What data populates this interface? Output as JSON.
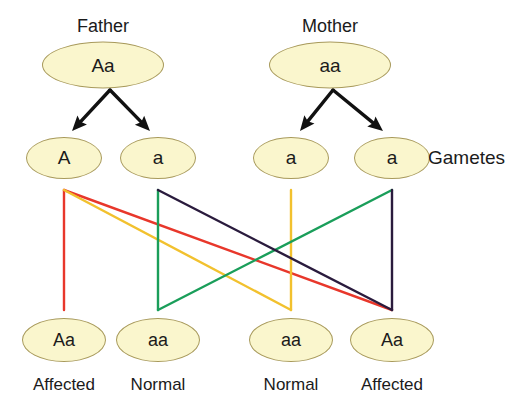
{
  "diagram": {
    "title_father": "Father",
    "title_mother": "Mother",
    "gametes_label": "Gametes"
  },
  "parents": [
    {
      "name": "father",
      "genotype": "Aa",
      "title": "Father",
      "cx": 103,
      "cy": 65,
      "title_cx": 103,
      "title_cy": 26
    },
    {
      "name": "mother",
      "genotype": "aa",
      "title": "Mother",
      "cx": 330,
      "cy": 65,
      "title_cx": 330,
      "title_cy": 26
    }
  ],
  "gametes": [
    {
      "name": "father-gamete-A",
      "allele": "A",
      "cx": 64,
      "cy": 158
    },
    {
      "name": "father-gamete-a",
      "allele": "a",
      "cx": 158,
      "cy": 158
    },
    {
      "name": "mother-gamete-a-1",
      "allele": "a",
      "cx": 291,
      "cy": 158
    },
    {
      "name": "mother-gamete-a-2",
      "allele": "a",
      "cx": 392,
      "cy": 158
    }
  ],
  "gametes_side_label": {
    "text": "Gametes",
    "x": 428,
    "y": 158
  },
  "offspring": [
    {
      "name": "offspring-1",
      "genotype": "Aa",
      "phenotype": "Affected",
      "cx": 64,
      "cy": 340,
      "label_cy": 385
    },
    {
      "name": "offspring-2",
      "genotype": "aa",
      "phenotype": "Normal",
      "cx": 158,
      "cy": 340,
      "label_cy": 385
    },
    {
      "name": "offspring-3",
      "genotype": "aa",
      "phenotype": "Normal",
      "cx": 291,
      "cy": 340,
      "label_cy": 385
    },
    {
      "name": "offspring-4",
      "genotype": "Aa",
      "phenotype": "Affected",
      "cx": 392,
      "cy": 340,
      "label_cy": 385
    }
  ],
  "meiosis_arrows": [
    {
      "name": "father-meiosis-arrows",
      "apex_x": 110,
      "apex_y": 90,
      "left_x": 72,
      "left_y": 131,
      "right_x": 150,
      "right_y": 131
    },
    {
      "name": "mother-meiosis-arrows",
      "apex_x": 333,
      "apex_y": 90,
      "left_x": 300,
      "left_y": 131,
      "right_x": 383,
      "right_y": 131
    }
  ],
  "fertilization_lines": [
    {
      "name": "line-red",
      "color": "#e8372b",
      "from_x": 64,
      "to_x": 392,
      "vertical_x": 64,
      "top_y": 190,
      "bottom_y": 310
    },
    {
      "name": "line-gold",
      "color": "#f2c12e",
      "from_x": 64,
      "to_x": 291,
      "vertical_x": 291,
      "top_y": 190,
      "bottom_y": 310
    },
    {
      "name": "line-green",
      "color": "#1a9e5a",
      "from_x": 392,
      "to_x": 158,
      "vertical_x": 158,
      "top_y": 190,
      "bottom_y": 310
    },
    {
      "name": "line-navy",
      "color": "#2a1b3d",
      "from_x": 158,
      "to_x": 392,
      "vertical_x": 392,
      "top_y": 190,
      "bottom_y": 310
    }
  ],
  "colors": {
    "node_fill": "#faf6cd",
    "node_stroke": "#a89a5c",
    "text": "#1b1b1b",
    "arrow": "#111111",
    "background": "#ffffff"
  }
}
